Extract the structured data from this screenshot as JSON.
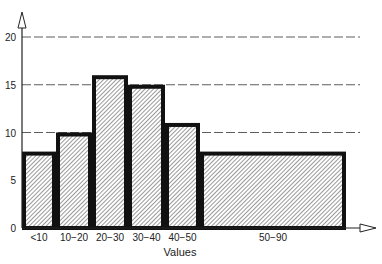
{
  "chart_data": {
    "type": "bar",
    "subtype": "histogram-variable-width",
    "title": "",
    "xlabel": "Values",
    "ylabel": "",
    "categories": [
      "<10",
      "10−20",
      "20−30",
      "30−40",
      "40−50",
      "50−90"
    ],
    "values": [
      8,
      10,
      16,
      15,
      11,
      8
    ],
    "ylim": [
      0,
      22
    ],
    "yticks": [
      0,
      5,
      10,
      15,
      20
    ],
    "grid": {
      "y": true,
      "style": "dashed",
      "lines_at": [
        10,
        15,
        20
      ]
    },
    "fill": "diagonal hatch",
    "legend": null
  },
  "colors": {
    "bar_outline": "#111111",
    "hatch": "#555555",
    "axis": "#222222",
    "grid": "#333333",
    "background": "#ffffff"
  }
}
